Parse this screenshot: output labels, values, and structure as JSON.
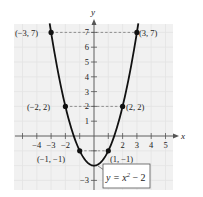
{
  "chart_data": {
    "type": "line",
    "title": "",
    "xlabel": "x",
    "ylabel": "y",
    "xlim": [
      -5,
      5
    ],
    "ylim": [
      -3,
      7
    ],
    "grid": true,
    "x_ticks": [
      -4,
      -3,
      -2,
      2,
      3,
      4,
      5
    ],
    "x_tick_labels": [
      "−4",
      "−3",
      "−2",
      "2",
      "3",
      "4",
      "5"
    ],
    "y_ticks": [
      7,
      6,
      5,
      4,
      3,
      2,
      1,
      -3
    ],
    "y_tick_labels": [
      "7",
      "6",
      "5",
      "4",
      "3",
      "2",
      "1",
      "−3"
    ],
    "series": [
      {
        "name": "y = x^2 - 2",
        "function": "x^2 - 2",
        "x": [
          -3,
          -2,
          -1,
          0,
          1,
          2,
          3
        ],
        "y": [
          7,
          2,
          -1,
          -2,
          -1,
          2,
          7
        ]
      }
    ],
    "points": [
      {
        "x": -3,
        "y": 7,
        "label": "(−3, 7)"
      },
      {
        "x": 3,
        "y": 7,
        "label": "(3, 7)"
      },
      {
        "x": -2,
        "y": 2,
        "label": "(−2, 2)"
      },
      {
        "x": 2,
        "y": 2,
        "label": "(2, 2)"
      },
      {
        "x": -1,
        "y": -1,
        "label": "(−1, −1)"
      },
      {
        "x": 1,
        "y": -1,
        "label": "(1, −1)"
      }
    ],
    "annotations": [
      {
        "text": "y = x² − 2",
        "points_to": {
          "x": 0.25,
          "y": -1.94
        }
      }
    ],
    "colors": {
      "curve": "#111111",
      "background_panel": "#f1f1f1",
      "grid": "#e2e2e2",
      "axes": "#555555",
      "dashed_guides": "#777777"
    }
  },
  "labels": {
    "x_axis": "x",
    "y_axis": "y",
    "equation_base": "y = x",
    "equation_exp": "2",
    "equation_tail": " − 2",
    "pt_m3_7": "(−3, 7)",
    "pt_3_7": "(3, 7)",
    "pt_m2_2": "(−2, 2)",
    "pt_2_2": "(2, 2)",
    "pt_m1_m1": "(−1, −1)",
    "pt_1_m1": "(1, −1)"
  }
}
